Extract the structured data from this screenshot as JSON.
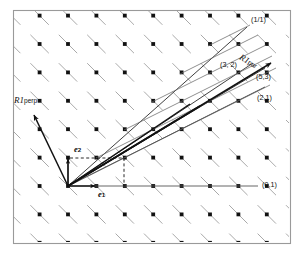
{
  "figure": {
    "kind": "lattice-vector-diagram",
    "background": "#ffffff",
    "ink": "#1a1a1a",
    "frame": {
      "x": 13,
      "y": 10,
      "width": 277,
      "height": 233,
      "stroke": "#9a9a9a"
    }
  },
  "labels": {
    "ratio_1_1": "(1/1)",
    "point_3_2": "(3, 2)",
    "point_5_3": "(5,3)",
    "point_2_1": "(2,1)",
    "point_0_1": "(0,1)",
    "r1_par_name": "R1",
    "r1_par_sub": "par",
    "r1_perp_name": "R1",
    "r1_perp_sub": "perp",
    "e1_name": "e",
    "e1_sub": "1",
    "e2_name": "e",
    "e2_sub": "2"
  },
  "chart_data": {
    "type": "scatter",
    "title": "",
    "xlabel": "",
    "ylabel": "",
    "origin_px": [
      68,
      186
    ],
    "lattice": {
      "dot_spacing_x_px": 28.4,
      "dot_spacing_y_px": 28.4,
      "segment_length_px": 26,
      "segment_angle_deg": -45,
      "dot_color": "#111111",
      "segment_color": "#9a9a9a",
      "cols": 9,
      "rows": 8
    },
    "rays": [
      {
        "name": "(1/1)",
        "slope": 1.0,
        "label": "(1/1)",
        "end_px": [
          247,
          28
        ]
      },
      {
        "name": "(3,2)",
        "slope": 0.6667,
        "label": "(3, 2)",
        "end_px": [
          251,
          64
        ]
      },
      {
        "name": "(5,3)",
        "slope": 0.6,
        "label": "(5,3)",
        "end_px": [
          262,
          76
        ]
      },
      {
        "name": "(2,1)",
        "slope": 0.5,
        "label": "(2,1)",
        "end_px": [
          262,
          89
        ]
      },
      {
        "name": "(0,1)",
        "slope": 0.0,
        "label": "(0,1)",
        "end_px": [
          256,
          186
        ]
      }
    ],
    "vectors": [
      {
        "name": "R1 par",
        "from_px": [
          68,
          186
        ],
        "to_px": [
          272,
          62
        ],
        "arrow": true,
        "angle_deg": 31
      },
      {
        "name": "R1 perp",
        "from_px": [
          68,
          186
        ],
        "to_px": [
          33,
          114
        ],
        "arrow": true,
        "angle_deg": 64
      },
      {
        "name": "e1",
        "from_px": [
          68,
          186
        ],
        "to_px": [
          96,
          186
        ],
        "arrow": true
      },
      {
        "name": "e2",
        "from_px": [
          68,
          186
        ],
        "to_px": [
          68,
          158
        ],
        "arrow": true
      }
    ],
    "legend_position": "none",
    "grid": false
  }
}
